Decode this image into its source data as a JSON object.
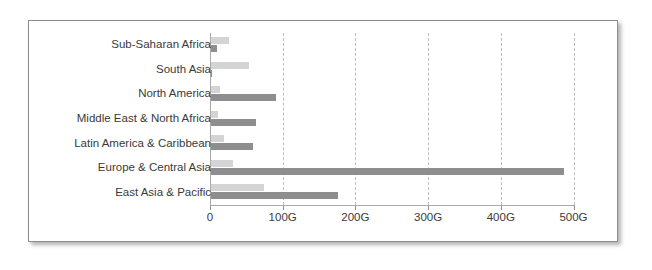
{
  "chart": {
    "frame_color": "#8c8c8c",
    "background": "#ffffff"
  },
  "chart_data": {
    "type": "bar",
    "orientation": "horizontal",
    "title": "",
    "subtitle": "",
    "xlabel": "",
    "ylabel": "",
    "grid": true,
    "legend": "none",
    "xlim": [
      0,
      520
    ],
    "categories": [
      "Sub-Saharan Africa",
      "South Asia",
      "North America",
      "Middle East & North Africa",
      "Latin America & Caribbean",
      "Europe & Central Asia",
      "East Asia & Pacific"
    ],
    "tick_values": [
      0,
      100,
      200,
      300,
      400,
      500
    ],
    "tick_labels": [
      "0",
      "100G",
      "200G",
      "300G",
      "400G",
      "500G"
    ],
    "unit": "G",
    "series": [
      {
        "name": "series-1",
        "color": "#d4d4d4",
        "values": [
          25,
          52,
          12,
          10,
          18,
          30,
          73
        ]
      },
      {
        "name": "series-2",
        "color": "#8e8e8e",
        "values": [
          8,
          1,
          90,
          62,
          58,
          485,
          175
        ]
      }
    ]
  }
}
